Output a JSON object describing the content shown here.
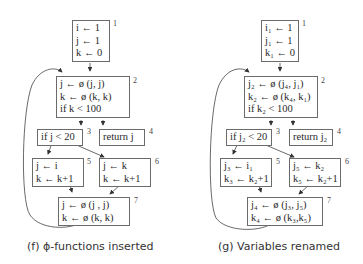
{
  "left": {
    "caption": "(f) ϕ-functions inserted",
    "blocks": [
      {
        "id": "1",
        "lines": [
          "i ← 1",
          "j ← 1",
          "k ← 0"
        ]
      },
      {
        "id": "2",
        "lines": [
          "j ← ø (j,  j)",
          "k ← ø (k, k)",
          "if k < 100"
        ]
      },
      {
        "id": "3",
        "lines": [
          "if j < 20"
        ]
      },
      {
        "id": "4",
        "lines": [
          "return  j"
        ]
      },
      {
        "id": "5",
        "lines": [
          "j ← i",
          "k ← k+1"
        ]
      },
      {
        "id": "6",
        "lines": [
          "j ← k",
          "k ← k+1"
        ]
      },
      {
        "id": "7",
        "lines": [
          "j ← ø (j , j)",
          "k ← ø (k, k)"
        ]
      }
    ]
  },
  "right": {
    "caption": "(g) Variables renamed",
    "blocks": [
      {
        "id": "1",
        "lines": [
          "i₁ ← 1",
          "j₁ ← 1",
          "k₁ ← 0"
        ]
      },
      {
        "id": "2",
        "lines": [
          "j₂ ← ø (j₄,  j₁)",
          "k₂ ← ø (k₄, k₁)",
          "if k₂ < 100"
        ]
      },
      {
        "id": "3",
        "lines": [
          "if j₂ < 20"
        ]
      },
      {
        "id": "4",
        "lines": [
          "return j₂"
        ]
      },
      {
        "id": "5",
        "lines": [
          "j₃ ← i₁",
          "k₃ ← k₂+1"
        ]
      },
      {
        "id": "6",
        "lines": [
          "j₅ ← k₂",
          "k₅ ← k₂+1"
        ]
      },
      {
        "id": "7",
        "lines": [
          "j₄ ← ø (j₃, j₅)",
          "k₄ ← ø (k₃,k₅)"
        ]
      }
    ]
  },
  "colors": {
    "box_border": "#6b6b6b",
    "edge": "#333333",
    "text": "#2a2a2a"
  }
}
